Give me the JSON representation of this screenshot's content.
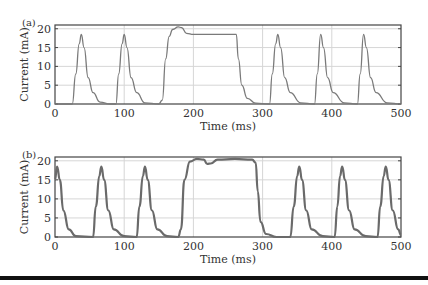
{
  "chart_data": [
    {
      "panel_label": "(a)",
      "type": "line",
      "title": "",
      "xlabel": "Time (ms)",
      "ylabel": "Current (mA)",
      "xlim": [
        0,
        500
      ],
      "ylim": [
        0,
        21
      ],
      "xticks": [
        0,
        100,
        200,
        300,
        400,
        500
      ],
      "yticks": [
        0,
        5,
        10,
        15,
        20
      ],
      "grid": true,
      "series": [
        {
          "name": "current",
          "description": "Periodic current pulses (~18.5 mA peaks) with a sustained plateau between ~150 and ~265 ms (overshoot to ~20.5 mA at ~180 ms, then ~18.5 mA)",
          "x": [
            0,
            25,
            30,
            35,
            38,
            42,
            48,
            55,
            65,
            80,
            88,
            92,
            97,
            100,
            104,
            110,
            118,
            130,
            150,
            155,
            160,
            165,
            170,
            178,
            183,
            190,
            200,
            230,
            262,
            265,
            270,
            278,
            290,
            310,
            314,
            319,
            322,
            326,
            332,
            340,
            355,
            375,
            379,
            384,
            388,
            394,
            402,
            418,
            437,
            441,
            446,
            450,
            456,
            464,
            480,
            500
          ],
          "values": [
            0,
            0,
            8,
            16,
            18.5,
            15,
            7,
            3,
            0.5,
            0,
            0,
            8,
            16,
            18.5,
            15,
            7,
            3,
            0.3,
            0,
            1,
            12,
            18,
            19.8,
            20.5,
            20.3,
            18.8,
            18.5,
            18.5,
            18.5,
            12,
            5,
            1.5,
            0.2,
            0,
            8,
            16,
            18.5,
            15,
            7,
            3,
            0.3,
            0,
            8,
            18.5,
            15,
            7,
            3,
            0.3,
            0,
            8,
            18.5,
            15,
            7,
            3,
            0.3,
            0
          ]
        }
      ]
    },
    {
      "panel_label": "(b)",
      "type": "line",
      "title": "",
      "xlabel": "Time (ms)",
      "ylabel": "Current (mA)",
      "xlim": [
        0,
        500
      ],
      "ylim": [
        0,
        21
      ],
      "xticks": [
        0,
        100,
        200,
        300,
        400,
        500
      ],
      "yticks": [
        0,
        5,
        10,
        15,
        20
      ],
      "grid": true,
      "series": [
        {
          "name": "current",
          "description": "Periodic current pulses (~18.5 mA peaks) with a plateau between ~182 and ~295 ms held near 20 mA with a dip to ~19 mA around 220 ms",
          "x": [
            0,
            3,
            7,
            12,
            20,
            30,
            55,
            59,
            64,
            67,
            71,
            77,
            85,
            100,
            118,
            122,
            127,
            130,
            134,
            140,
            148,
            162,
            178,
            182,
            187,
            195,
            205,
            215,
            220,
            225,
            235,
            260,
            285,
            290,
            293,
            297,
            305,
            320,
            340,
            345,
            350,
            353,
            357,
            363,
            371,
            387,
            404,
            408,
            412,
            415,
            419,
            425,
            433,
            449,
            466,
            470,
            475,
            478,
            482,
            488,
            496,
            500
          ],
          "values": [
            15,
            18.5,
            15,
            7,
            2,
            0.2,
            0,
            8,
            16,
            18.5,
            15,
            7,
            2,
            0.2,
            0,
            8,
            16,
            18.5,
            15,
            7,
            2,
            0.2,
            0,
            2,
            15,
            19.8,
            20.5,
            20.3,
            19.2,
            19.3,
            20.3,
            20.5,
            20.3,
            19.5,
            12,
            4,
            0.8,
            0,
            0,
            8,
            16,
            18.5,
            15,
            7,
            2,
            0.2,
            0,
            8,
            16,
            18.5,
            15,
            7,
            2,
            0.2,
            0,
            8,
            16,
            18.5,
            15,
            7,
            2,
            0.5
          ]
        }
      ]
    }
  ],
  "plots": {
    "a": {
      "panel": "(a)",
      "ylabel": "Current (mA)",
      "xlabel": "Time (ms)"
    },
    "b": {
      "panel": "(b)",
      "ylabel": "Current (mA)",
      "xlabel": "Time (ms)"
    }
  },
  "ticks": {
    "x": [
      "0",
      "100",
      "200",
      "300",
      "400",
      "500"
    ],
    "y": [
      "0",
      "5",
      "10",
      "15",
      "20"
    ]
  },
  "colors": {
    "line_a": "#7a7a7a",
    "line_b": "#6a6a6a",
    "grid": "#d6d6d6",
    "axis": "#444444"
  }
}
